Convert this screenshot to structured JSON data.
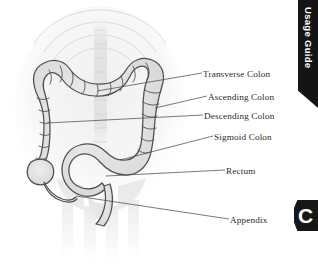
{
  "page": {
    "background_color": "#ffffff",
    "width": 318,
    "height": 268
  },
  "figure": {
    "name": "large-intestine-anatomy-illustration",
    "style": "grayscale medical line drawing of the colon over a faint skeletal torso",
    "outline_color": "#4a4a4a",
    "fill_color": "#e3e3e3",
    "body_tint": "#ededed"
  },
  "labels": [
    {
      "id": "transverse",
      "text": "Transverse Colon"
    },
    {
      "id": "ascending",
      "text": "Ascending Colon"
    },
    {
      "id": "descending",
      "text": "Descending Colon"
    },
    {
      "id": "sigmoid",
      "text": "Sigmoid Colon"
    },
    {
      "id": "rectum",
      "text": "Rectum"
    },
    {
      "id": "appendix",
      "text": "Appendix"
    }
  ],
  "leader_line_color": "#4d4d52",
  "tabs": {
    "usage_guide": {
      "label": "Usage Guide",
      "background_color": "#141414",
      "text_color": "#ffffff"
    },
    "chapter": {
      "label": "C",
      "background_color": "#171717",
      "text_color": "#ffffff"
    }
  }
}
